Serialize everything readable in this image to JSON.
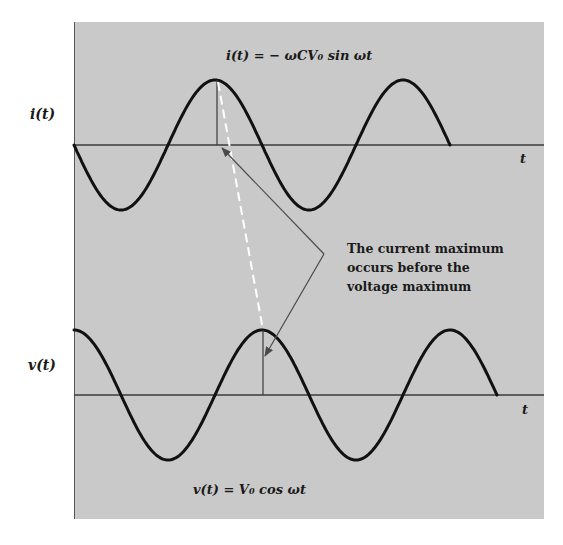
{
  "figure": {
    "background_color": "#ffffff",
    "panel_color": "#c9c9c9",
    "curve_color": "#111111",
    "axis_color": "#3a3a3a",
    "arrow_color": "#4a4a4a",
    "dashed_line_color": "#ffffff"
  },
  "top_plot": {
    "ylabel": "i(t)",
    "xlabel": "t",
    "equation": "i(t) = − ωCV₀ sin ωt"
  },
  "bottom_plot": {
    "ylabel": "v(t)",
    "xlabel": "t",
    "equation": "v(t) = V₀ cos ωt"
  },
  "annotation": {
    "lines": [
      "The current maximum",
      "occurs before the",
      "voltage maximum"
    ]
  },
  "chart_data": [
    {
      "type": "line",
      "title": "i(t) = −ωCV₀ sin ωt",
      "xlabel": "t",
      "ylabel": "i(t)",
      "function": "-sin(ωt)",
      "x_range_cycles": [
        0,
        2.0
      ],
      "series": [
        {
          "name": "i(t)",
          "shape": "negative sine",
          "cycles_shown": 2.0,
          "amplitude": 1
        }
      ],
      "markers": [
        {
          "label": "current maximum",
          "phase_deg": 270
        }
      ],
      "grid": false
    },
    {
      "type": "line",
      "title": "v(t) = V₀ cos ωt",
      "xlabel": "t",
      "ylabel": "v(t)",
      "function": "cos(ωt)",
      "x_range_cycles": [
        0,
        2.25
      ],
      "series": [
        {
          "name": "v(t)",
          "shape": "cosine",
          "cycles_shown": 2.25,
          "amplitude": 1
        }
      ],
      "markers": [
        {
          "label": "voltage maximum",
          "phase_deg": 360
        }
      ],
      "grid": false
    }
  ]
}
